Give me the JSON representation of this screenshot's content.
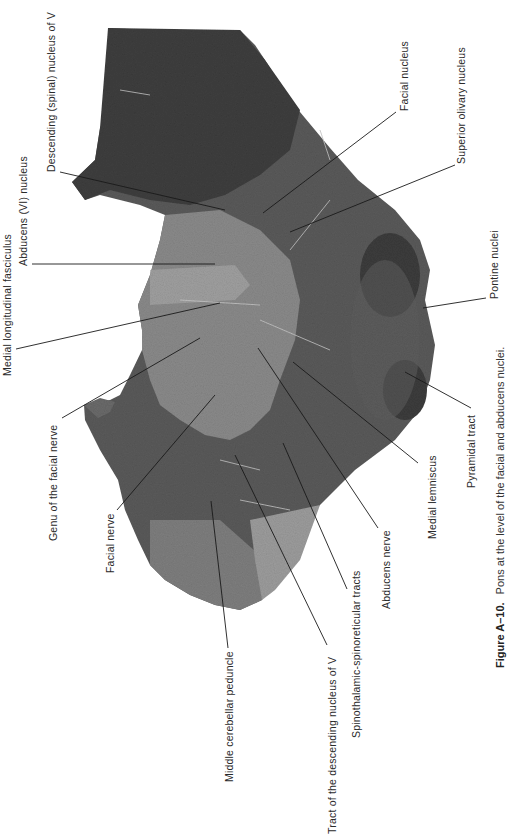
{
  "figure": {
    "number": "Figure A–10.",
    "caption": "Pons at the level of the facial and abducens nuclei."
  },
  "labels": [
    {
      "id": "medial-longitudinal-fasciculus",
      "text": "Medial longitudinal fasciculus"
    },
    {
      "id": "descending-spinal-nucleus-v",
      "text": "Descending (spinal) nucleus of V"
    },
    {
      "id": "abducens-vi-nucleus",
      "text": "Abducens (VI) nucleus"
    },
    {
      "id": "genu-of-facial-nerve",
      "text": "Genu of the facial nerve"
    },
    {
      "id": "facial-nerve",
      "text": "Facial nerve"
    },
    {
      "id": "middle-cerebellar-peduncle",
      "text": "Middle cerebellar peduncle"
    },
    {
      "id": "tract-descending-nucleus-v",
      "text": "Tract of the descending nucleus of V"
    },
    {
      "id": "spinothalamic-spinoreticular-tracts",
      "text": "Spinothalamic-spinoreticular tracts"
    },
    {
      "id": "abducens-nerve",
      "text": "Abducens nerve"
    },
    {
      "id": "medial-lemniscus",
      "text": "Medial lemniscus"
    },
    {
      "id": "pyramidal-tract",
      "text": "Pyramidal tract"
    },
    {
      "id": "pontine-nuclei",
      "text": "Pontine nuclei"
    },
    {
      "id": "facial-nucleus",
      "text": "Facial nucleus"
    },
    {
      "id": "superior-olivary-nucleus",
      "text": "Superior olivary nucleus"
    }
  ],
  "colors": {
    "tissue_dark": "#4a4a4a",
    "tissue_mid": "#6e6e6e",
    "tissue_light": "#9a9a9a",
    "line": "#1a1a1a"
  }
}
